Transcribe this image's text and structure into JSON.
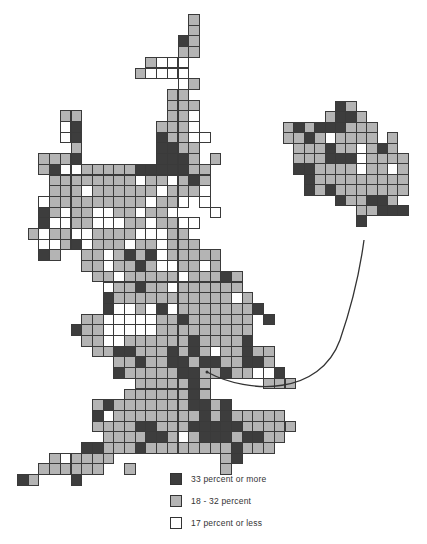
{
  "colors": {
    "dark": "#3d3d3d",
    "light": "#b4b4b4",
    "white": "#ffffff"
  },
  "legend": {
    "items": [
      {
        "key": "D",
        "label": "33 percent or more"
      },
      {
        "key": "L",
        "label": "18 - 32 percent"
      },
      {
        "key": "W",
        "label": "17 percent or less"
      }
    ]
  },
  "main_grid": {
    "x0": 17,
    "y0": 14,
    "cell": 10.7,
    "rows": [
      "................L.........",
      "................L.........",
      "...............DL.........",
      "...............LL.........",
      "............LWWW..........",
      "...........LWWWW..........",
      "...............WL.........",
      "..............LL..........",
      "..............LLL.........",
      "....LL........LLW.........",
      "....WD.......LLLW.........",
      "....WD.......DLLWW........",
      ".....L.......DDLL.........",
      "..LLLD.......DDDL.L.......",
      "..LDWWLLLLLDDDDDLL........",
      "...LLLLLLLLWLLWLDL........",
      "...LLLWLLLLLLWLLLW........",
      "..WLLLLLLLLLWLLW.W........",
      "..DLWLLWWLLWLLW...W.......",
      "..DWWLLWWWLLWLLWW.........",
      ".LWLLWWLLLLWWWLL..........",
      "..WWLDWLLLWLLWLLL.........",
      "..DL..LLWLDLDWLLLLL.......",
      "......LLWLLDLWWLLWL.......",
      ".......LLWLLLLLWLLLDL.....",
      "........WLLDLLWLLLLLL.....",
      "........DLLLLLLLLLLL.L....",
      "........DWWLWDWLLLLLLLD...",
      "......LLWWWWWLLDLLLLLL.D...",
      ".....DLLWWWWWLLLLLLLLL....",
      "......LLWWLLLLLLDLLLLD....",
      ".......LLDDLLLDLDLWLLDLL..",
      ".........LLDLLDDLDDLLDDL..",
      ".........DLLLLLDDLLDLLWWD.",
      "...........LLLLLDL.....LLL",
      "..........LLLLLLDL........",
      ".......LDLLLLLLLDDLD......",
      ".......DWLLLLLLLLDLDLLLLL.",
      ".......LLLLDDLLLDDDDDLLLLL",
      "........LLLLDDLWLDDDLDDLL.",
      "......DDLLLDLLLLLLLLDLLL..",
      "...LWLLLL..........LD.....",
      "..LLLLLL..L........L......",
      "DL...D...................."
    ]
  },
  "island_grid": {
    "x0": 283,
    "y0": 101,
    "cell": 10.4,
    "rows": [
      ".....DL.....",
      "....LDDL....",
      "LDLDDDLLL...",
      "LLDLWLLLL.L.",
      ".LLLDLLWLDL.",
      ".LLLDDDWLLLL",
      ".DDLLLLWLLWL",
      "..DLLLLLLLLL",
      "..DLDLLLLLLL",
      ".....DLLDDL.",
      ".......LLDDD",
      ".......D...."
    ]
  },
  "arrow": {
    "from": [
      207,
      372
    ],
    "to": [
      364,
      240
    ]
  }
}
